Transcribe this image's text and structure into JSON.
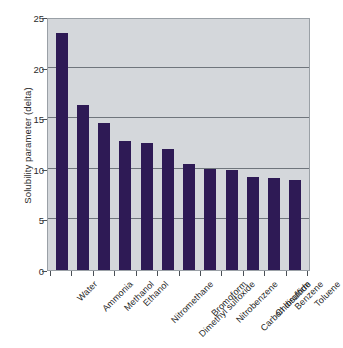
{
  "chart_data": {
    "type": "bar",
    "title": "",
    "subtitle": "",
    "xlabel": "",
    "ylabel": "Solubility parameter (delta)",
    "categories": [
      "Water",
      "Ammonia",
      "Methanol",
      "Ethanol",
      "Nitromethane",
      "Dimethyl sulfoxide",
      "Bromoform",
      "Nitrobenzene",
      "Carbon disulfide",
      "Chloroform",
      "Benzene",
      "Toluene"
    ],
    "values": [
      23.4,
      16.3,
      14.5,
      12.7,
      12.6,
      12.0,
      10.5,
      10.0,
      9.9,
      9.2,
      9.1,
      8.9
    ],
    "ylim": [
      0,
      25
    ],
    "yticks": [
      0,
      5,
      10,
      15,
      20,
      25
    ],
    "ytick_labels": [
      "0",
      "5",
      "10",
      "15",
      "20",
      "25"
    ],
    "grid": true,
    "grid_axis": "y",
    "legend": false,
    "legend_position": "none",
    "series_name": "Solubility parameter",
    "bar_color": "#2e1a55",
    "plot_background": "#d4d7db",
    "gridline_color": "#6f757c",
    "axis_color": "#4a4f55",
    "text_color": "#1f1f1f"
  }
}
